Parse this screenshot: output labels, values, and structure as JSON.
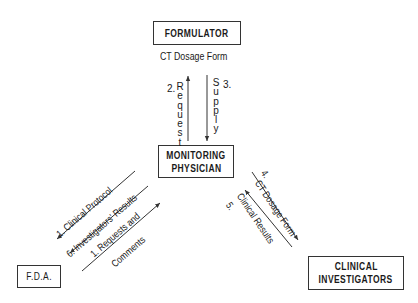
{
  "nodes": {
    "formulator": {
      "label": "FORMULATOR"
    },
    "monitoring_physician": {
      "line1": "MONITORING",
      "line2": "PHYSICIAN"
    },
    "fda": {
      "label": "F.D.A."
    },
    "clinical_investigators": {
      "line1": "CLINICAL",
      "line2": "INVESTIGATORS"
    }
  },
  "labels": {
    "formulator_caption": "CT Dosage Form",
    "request_num": "2.",
    "request_letters": [
      "R",
      "e",
      "q",
      "u",
      "e",
      "s",
      "t"
    ],
    "supply_num": "3.",
    "supply_letters": [
      "S",
      "u",
      "p",
      "p",
      "l",
      "y"
    ],
    "clinical_protocol": "1. Clinical Protocol",
    "investigators_results": "6. Investigators' Results",
    "requests_and": "1. Requests and",
    "comments": "Comments",
    "ct_dosage_num": "4.",
    "ct_dosage_form": "CT Dosage Form",
    "clinical_results_num": "5.",
    "clinical_results": "Clinical Results"
  },
  "edges": [
    {
      "from": "monitoring_physician",
      "to": "formulator",
      "label": "2. Request"
    },
    {
      "from": "formulator",
      "to": "monitoring_physician",
      "label": "3. Supply"
    },
    {
      "from": "monitoring_physician",
      "to": "fda",
      "label": "1. Clinical Protocol"
    },
    {
      "from": "monitoring_physician",
      "to": "fda",
      "label": "6. Investigators' Results"
    },
    {
      "from": "fda",
      "to": "monitoring_physician",
      "label": "1. Requests and Comments"
    },
    {
      "from": "monitoring_physician",
      "to": "clinical_investigators",
      "label": "4. CT Dosage Form"
    },
    {
      "from": "clinical_investigators",
      "to": "monitoring_physician",
      "label": "5. Clinical Results"
    }
  ],
  "colors": {
    "line": "#333333",
    "background": "#ffffff",
    "text": "#1a1a1a"
  }
}
